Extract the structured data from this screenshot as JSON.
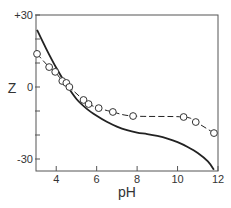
{
  "chart_data": {
    "type": "line",
    "title": "",
    "xlabel": "pH",
    "ylabel": "Z",
    "xlim": [
      3,
      12
    ],
    "ylim": [
      -33,
      30
    ],
    "grid": false,
    "legend": null,
    "x_ticks": [
      {
        "value": 4,
        "label": "4"
      },
      {
        "value": 6,
        "label": "6"
      },
      {
        "value": 8,
        "label": "8"
      },
      {
        "value": 10,
        "label": "10"
      },
      {
        "value": 12,
        "label": "12"
      }
    ],
    "y_ticks": [
      {
        "value": 30,
        "label": "+30"
      },
      {
        "value": 20,
        "label": ""
      },
      {
        "value": 10,
        "label": ""
      },
      {
        "value": 0,
        "label": "0"
      },
      {
        "value": -10,
        "label": ""
      },
      {
        "value": -20,
        "label": ""
      },
      {
        "value": -30,
        "label": "-30"
      }
    ],
    "series": [
      {
        "name": "calculated",
        "style": "solid",
        "markers": false,
        "x": [
          3.05,
          3.5,
          4.0,
          4.5,
          5.0,
          5.5,
          6.0,
          6.5,
          7.0,
          7.5,
          8.0,
          8.5,
          9.0,
          9.5,
          10.0,
          10.5,
          11.0,
          11.5,
          11.8
        ],
        "y": [
          23.8,
          16.0,
          8.0,
          1.0,
          -5.0,
          -9.0,
          -12.0,
          -14.5,
          -16.5,
          -18.0,
          -19.0,
          -19.6,
          -20.4,
          -21.5,
          -23.0,
          -25.0,
          -27.5,
          -31.0,
          -34.5
        ]
      },
      {
        "name": "measured",
        "style": "dashed",
        "markers": true,
        "marker": "open-circle",
        "x": [
          3.05,
          3.65,
          3.95,
          4.3,
          4.5,
          4.65,
          5.35,
          5.6,
          6.1,
          6.8,
          7.8,
          10.3,
          10.9,
          11.8
        ],
        "y": [
          13.8,
          8.3,
          6.3,
          2.5,
          1.7,
          0.0,
          -5.4,
          -7.1,
          -8.8,
          -10.4,
          -12.1,
          -12.5,
          -14.6,
          -19.2
        ]
      }
    ]
  }
}
